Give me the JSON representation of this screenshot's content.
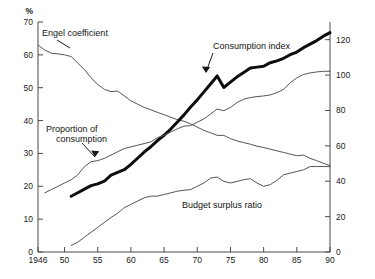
{
  "chart_data": {
    "type": "line",
    "title": "",
    "subtitle": "",
    "xlabel": "",
    "ylabel": "%",
    "ylabel_right": "",
    "xlim": [
      1946,
      1990
    ],
    "ylim": [
      0,
      70
    ],
    "ylim_right": [
      0,
      130
    ],
    "grid": false,
    "legend": "inline-annotations",
    "x_tick_labels": [
      "1946",
      "50",
      "55",
      "60",
      "65",
      "70",
      "75",
      "80",
      "85",
      "90"
    ],
    "x_ticks": [
      1946,
      1950,
      1955,
      1960,
      1965,
      1970,
      1975,
      1980,
      1985,
      1990
    ],
    "y_tick_labels_left": [
      "0",
      "10",
      "20",
      "30",
      "40",
      "50",
      "60",
      "70"
    ],
    "y_ticks_left": [
      0,
      10,
      20,
      30,
      40,
      50,
      60,
      70
    ],
    "y_tick_labels_right": [
      "0",
      "20",
      "40",
      "60",
      "80",
      "100",
      "120"
    ],
    "y_ticks_right": [
      0,
      20,
      40,
      60,
      80,
      100,
      120
    ],
    "left_axis_unit": "%",
    "series": [
      {
        "name": "Engel coefficient",
        "axis": "left",
        "style": "thin",
        "label_x": 1950,
        "label_y": 68,
        "x": [
          1946,
          1947,
          1948,
          1949,
          1950,
          1951,
          1952,
          1953,
          1954,
          1955,
          1956,
          1957,
          1958,
          1959,
          1960,
          1961,
          1962,
          1963,
          1964,
          1965,
          1966,
          1967,
          1968,
          1969,
          1970,
          1971,
          1972,
          1973,
          1974,
          1975,
          1976,
          1977,
          1978,
          1979,
          1980,
          1981,
          1982,
          1983,
          1984,
          1985,
          1986,
          1987,
          1988,
          1989,
          1990
        ],
        "values": [
          63.0,
          61.5,
          60.5,
          60.3,
          60.0,
          59.5,
          57.5,
          55.5,
          53.0,
          51.0,
          49.5,
          48.8,
          49.0,
          47.5,
          46.0,
          45.0,
          44.0,
          43.3,
          42.5,
          41.8,
          41.0,
          40.3,
          39.8,
          39.0,
          38.0,
          37.0,
          36.3,
          35.5,
          35.5,
          34.5,
          33.8,
          33.3,
          32.8,
          32.2,
          31.8,
          31.3,
          30.8,
          30.3,
          29.8,
          29.3,
          29.5,
          28.5,
          27.8,
          27.0,
          26.3
        ]
      },
      {
        "name": "Consumption index",
        "axis": "right",
        "style": "thick",
        "label_x": 1973,
        "label_y": 112,
        "x": [
          1951,
          1952,
          1953,
          1954,
          1955,
          1956,
          1957,
          1958,
          1959,
          1960,
          1961,
          1962,
          1963,
          1964,
          1965,
          1966,
          1967,
          1968,
          1969,
          1970,
          1971,
          1972,
          1973,
          1974,
          1975,
          1976,
          1977,
          1978,
          1979,
          1980,
          1981,
          1982,
          1983,
          1984,
          1985,
          1986,
          1987,
          1988,
          1989,
          1990
        ],
        "values": [
          31.5,
          33.5,
          35.5,
          37.5,
          38.5,
          40.0,
          43.5,
          45.0,
          46.5,
          49.5,
          53.0,
          56.5,
          59.5,
          63.0,
          66.0,
          69.5,
          73.5,
          77.5,
          82.0,
          86.0,
          90.5,
          95.0,
          99.5,
          93.0,
          96.0,
          99.0,
          101.5,
          104.0,
          104.5,
          105.0,
          107.0,
          108.0,
          109.5,
          111.5,
          113.0,
          115.5,
          117.5,
          119.5,
          122.0,
          124.0
        ]
      },
      {
        "name": "Proportion of consumption",
        "axis": "left",
        "style": "thin",
        "label_x": 1951,
        "label_y": 40.5,
        "x": [
          1947,
          1948,
          1949,
          1950,
          1951,
          1952,
          1953,
          1954,
          1955,
          1956,
          1957,
          1958,
          1959,
          1960,
          1961,
          1962,
          1963,
          1964,
          1965,
          1966,
          1967,
          1968,
          1969,
          1970,
          1971,
          1972,
          1973,
          1974,
          1975,
          1976,
          1977,
          1978,
          1979,
          1980,
          1981,
          1982,
          1983,
          1984,
          1985,
          1986,
          1987,
          1988,
          1989,
          1990
        ],
        "values": [
          18.0,
          19.0,
          20.0,
          21.0,
          22.0,
          23.5,
          26.0,
          27.5,
          27.8,
          28.5,
          29.5,
          30.5,
          31.5,
          32.0,
          32.5,
          33.0,
          33.5,
          34.8,
          35.5,
          36.5,
          37.5,
          38.3,
          38.5,
          39.5,
          40.5,
          42.0,
          43.5,
          43.0,
          44.0,
          45.5,
          46.5,
          47.0,
          47.3,
          47.5,
          47.8,
          48.5,
          49.5,
          51.5,
          53.0,
          54.0,
          54.5,
          54.8,
          55.0,
          55.0
        ]
      },
      {
        "name": "Budget surplus ratio",
        "axis": "left",
        "style": "thin",
        "label_x": 1977,
        "label_y": 17.5,
        "x": [
          1951,
          1952,
          1953,
          1954,
          1955,
          1956,
          1957,
          1958,
          1959,
          1960,
          1961,
          1962,
          1963,
          1964,
          1965,
          1966,
          1967,
          1968,
          1969,
          1970,
          1971,
          1972,
          1973,
          1974,
          1975,
          1976,
          1977,
          1978,
          1979,
          1980,
          1981,
          1982,
          1983,
          1984,
          1985,
          1986,
          1987,
          1988,
          1989,
          1990
        ],
        "values": [
          2.0,
          3.0,
          4.5,
          6.0,
          7.5,
          9.0,
          10.5,
          11.8,
          13.5,
          14.5,
          15.5,
          16.5,
          17.0,
          17.0,
          17.5,
          18.0,
          18.5,
          18.8,
          19.0,
          20.0,
          21.0,
          22.5,
          22.8,
          21.5,
          21.0,
          21.5,
          22.0,
          22.3,
          21.0,
          20.0,
          20.5,
          21.8,
          23.5,
          24.0,
          24.5,
          25.0,
          26.0,
          26.0,
          26.0,
          26.0
        ]
      }
    ],
    "annotations": [
      {
        "text": "Engel coefficient",
        "target_x": 1948.5,
        "target_y": 61.0
      },
      {
        "text": "Proportion of consumption",
        "target_x": 1953.0,
        "target_y": 26.3
      },
      {
        "text": "Consumption index",
        "target_x": 1973.0,
        "target_y": 99.5
      },
      {
        "text": "Budget surplus ratio",
        "target_x": 0,
        "target_y": 0
      }
    ]
  },
  "labels": {
    "engel": "Engel coefficient",
    "consumption_index": "Consumption index",
    "proportion_line1": "Proportion of",
    "proportion_line2": "consumption",
    "budget": "Budget surplus ratio",
    "percent_unit": "%"
  },
  "x_axis": {
    "t0": "1946",
    "t1": "50",
    "t2": "55",
    "t3": "60",
    "t4": "65",
    "t5": "70",
    "t6": "75",
    "t7": "80",
    "t8": "85",
    "t9": "90"
  },
  "y_axis_left": {
    "t0": "0",
    "t1": "10",
    "t2": "20",
    "t3": "30",
    "t4": "40",
    "t5": "50",
    "t6": "60",
    "t7": "70"
  },
  "y_axis_right": {
    "t0": "0",
    "t1": "20",
    "t2": "40",
    "t3": "60",
    "t4": "80",
    "t5": "100",
    "t6": "120"
  }
}
